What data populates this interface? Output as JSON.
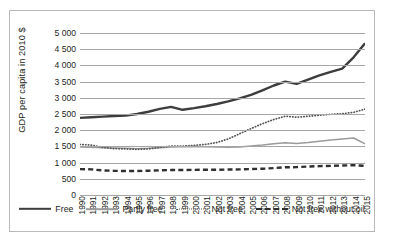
{
  "chart_data": {
    "type": "line",
    "title": "",
    "xlabel": "",
    "ylabel": "GDP per capita in 2010 $",
    "ylim": [
      0,
      5000
    ],
    "ytick_step": 500,
    "grid": true,
    "legend_position": "bottom",
    "yticks": [
      "0",
      "500",
      "1 000",
      "1 500",
      "2 000",
      "2 500",
      "3 000",
      "3 500",
      "4 000",
      "4 500",
      "5 000"
    ],
    "categories": [
      "1990",
      "1991",
      "1992",
      "1993",
      "1994",
      "1995",
      "1996",
      "1997",
      "1998",
      "1999",
      "2000",
      "2001",
      "2002",
      "2003",
      "2004",
      "2005",
      "2006",
      "2007",
      "2008",
      "2009",
      "2010",
      "2011",
      "2012",
      "2013",
      "2014",
      "2015"
    ],
    "series": [
      {
        "name": "Free",
        "style": "solid-thick",
        "color": "#3d3d3d",
        "values": [
          2380,
          2400,
          2420,
          2440,
          2450,
          2500,
          2570,
          2660,
          2720,
          2630,
          2680,
          2740,
          2810,
          2890,
          2980,
          3090,
          3230,
          3380,
          3500,
          3430,
          3560,
          3690,
          3800,
          3900,
          4250,
          4680
        ]
      },
      {
        "name": "Partly free",
        "style": "solid-thin",
        "color": "#9b9b9b",
        "values": [
          1480,
          1470,
          1460,
          1450,
          1440,
          1430,
          1440,
          1460,
          1480,
          1490,
          1500,
          1490,
          1480,
          1470,
          1480,
          1510,
          1540,
          1580,
          1610,
          1590,
          1620,
          1660,
          1700,
          1730,
          1760,
          1580
        ]
      },
      {
        "name": "Not free",
        "style": "dotted",
        "color": "#555555",
        "values": [
          1560,
          1540,
          1470,
          1430,
          1420,
          1410,
          1420,
          1470,
          1510,
          1510,
          1530,
          1560,
          1620,
          1730,
          1890,
          2050,
          2200,
          2330,
          2430,
          2400,
          2430,
          2460,
          2490,
          2510,
          2550,
          2650
        ]
      },
      {
        "name": "Not free without oil",
        "style": "dashed",
        "color": "#2f2f2f",
        "values": [
          800,
          790,
          760,
          745,
          740,
          740,
          750,
          760,
          770,
          770,
          775,
          780,
          780,
          785,
          790,
          800,
          810,
          830,
          855,
          860,
          880,
          890,
          900,
          910,
          920,
          900
        ]
      }
    ]
  },
  "legend": {
    "items": [
      {
        "label": "Free"
      },
      {
        "label": "Partly free"
      },
      {
        "label": "Not free"
      },
      {
        "label": "Not free without oil"
      }
    ]
  }
}
